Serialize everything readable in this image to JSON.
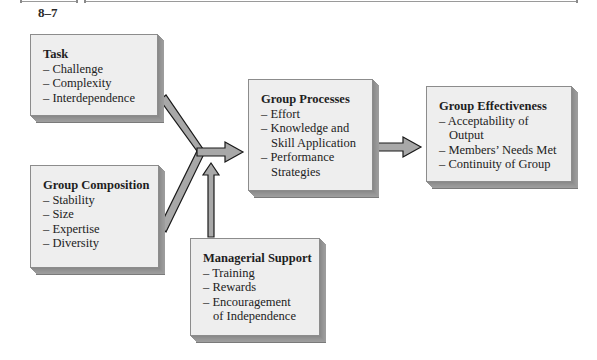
{
  "figure": {
    "number": "8–7"
  },
  "boxes": {
    "task": {
      "title": "Task",
      "items": [
        "– Challenge",
        "– Complexity",
        "– Interdependence"
      ]
    },
    "composition": {
      "title": "Group Composition",
      "items": [
        "– Stability",
        "– Size",
        "– Expertise",
        "– Diversity"
      ]
    },
    "processes": {
      "title": "Group Processes",
      "items": [
        "– Effort",
        "– Knowledge and",
        "Skill Application",
        "– Performance",
        "Strategies"
      ]
    },
    "effectiveness": {
      "title": "Group Effectiveness",
      "items": [
        "– Acceptability of",
        "Output",
        "– Members’ Needs Met",
        "– Continuity of Group"
      ]
    },
    "support": {
      "title": "Managerial Support",
      "items": [
        "– Training",
        "– Rewards",
        "– Encouragement",
        "of Independence"
      ]
    }
  },
  "colors": {
    "box_fill": "#eeeeee",
    "box_shadow": "#9a9a9a",
    "arrow_fill": "#a8a8a8",
    "arrow_stroke": "#1a1a1a"
  }
}
